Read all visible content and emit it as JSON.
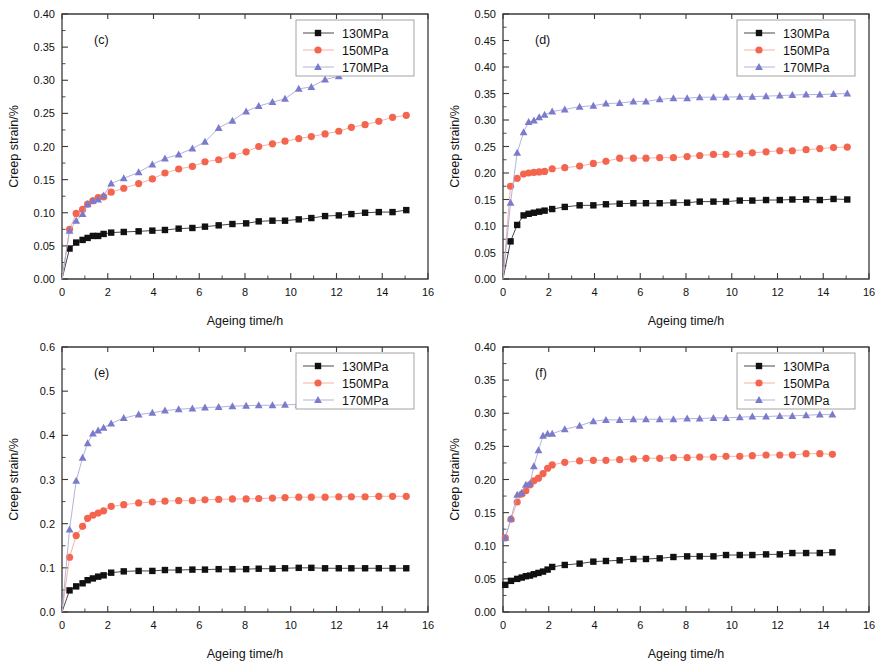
{
  "figure": {
    "panel_count": 4,
    "shared_xlabel": "Ageing time/h",
    "shared_ylabel": "Creep strain/%",
    "legend_entries": [
      "130MPa",
      "150MPa",
      "170MPa"
    ],
    "colors": {
      "130MPa": "#111111",
      "150MPa": "#F4654F",
      "170MPa": "#7B7BCB",
      "line_130MPa": "#333333",
      "line_150MPa": "#F6A79A",
      "line_170MPa": "#A9A9DC",
      "axis": "#3a3a3a",
      "background": "#ffffff"
    },
    "markers": {
      "130MPa": "filled-square",
      "150MPa": "filled-circle",
      "170MPa": "filled-triangle"
    }
  },
  "chart_data": [
    {
      "type": "line",
      "panel": "c",
      "panel_label": "(c)",
      "title": "",
      "xlabel": "Ageing time/h",
      "ylabel": "Creep strain/%",
      "xlim": [
        0,
        16
      ],
      "ylim": [
        0,
        0.4
      ],
      "xticks": [
        0,
        2,
        4,
        6,
        8,
        10,
        12,
        14,
        16
      ],
      "yticks": [
        0.0,
        0.05,
        0.1,
        0.15,
        0.2,
        0.25,
        0.3,
        0.35,
        0.4
      ],
      "ytick_labels": [
        "0.00",
        "0.05",
        "0.10",
        "0.15",
        "0.20",
        "0.25",
        "0.30",
        "0.35",
        "0.40"
      ],
      "grid": false,
      "legend_position": "top-right",
      "series": [
        {
          "name": "130MPa",
          "x": [
            0.0,
            0.33,
            0.62,
            0.9,
            1.12,
            1.35,
            1.58,
            1.82,
            2.15,
            2.7,
            3.35,
            3.95,
            4.5,
            5.1,
            5.7,
            6.25,
            6.85,
            7.45,
            8.05,
            8.6,
            9.2,
            9.75,
            10.35,
            10.9,
            11.5,
            12.1,
            12.65,
            13.25,
            13.85,
            14.45,
            15.05
          ],
          "values": [
            0.0,
            0.046,
            0.055,
            0.059,
            0.062,
            0.065,
            0.065,
            0.068,
            0.07,
            0.071,
            0.072,
            0.073,
            0.074,
            0.076,
            0.077,
            0.079,
            0.081,
            0.083,
            0.084,
            0.087,
            0.088,
            0.088,
            0.09,
            0.092,
            0.095,
            0.096,
            0.098,
            0.1,
            0.101,
            0.101,
            0.104
          ]
        },
        {
          "name": "150MPa",
          "x": [
            0.0,
            0.33,
            0.62,
            0.9,
            1.12,
            1.35,
            1.58,
            1.82,
            2.15,
            2.7,
            3.35,
            3.95,
            4.5,
            5.1,
            5.7,
            6.25,
            6.85,
            7.45,
            8.05,
            8.6,
            9.2,
            9.75,
            10.35,
            10.9,
            11.5,
            12.1,
            12.65,
            13.25,
            13.85,
            14.45,
            15.05
          ],
          "values": [
            0.0,
            0.075,
            0.099,
            0.105,
            0.113,
            0.118,
            0.123,
            0.124,
            0.131,
            0.137,
            0.144,
            0.151,
            0.16,
            0.166,
            0.17,
            0.177,
            0.18,
            0.186,
            0.192,
            0.2,
            0.204,
            0.208,
            0.212,
            0.215,
            0.219,
            0.223,
            0.229,
            0.233,
            0.238,
            0.244,
            0.247
          ]
        },
        {
          "name": "170MPa",
          "x": [
            0.0,
            0.33,
            0.62,
            0.9,
            1.12,
            1.35,
            1.58,
            1.82,
            2.15,
            2.7,
            3.35,
            3.95,
            4.5,
            5.1,
            5.7,
            6.25,
            6.85,
            7.45,
            8.05,
            8.6,
            9.2,
            9.75,
            10.35,
            10.9,
            11.5,
            12.1,
            12.65,
            13.25,
            13.85,
            14.45,
            15.05
          ],
          "values": [
            0.0,
            0.073,
            0.088,
            0.098,
            0.113,
            0.118,
            0.12,
            0.126,
            0.144,
            0.152,
            0.161,
            0.173,
            0.182,
            0.188,
            0.197,
            0.207,
            0.228,
            0.239,
            0.253,
            0.261,
            0.267,
            0.272,
            0.287,
            0.29,
            0.301,
            0.306,
            0.311,
            0.321,
            0.327,
            0.332,
            0.342
          ]
        }
      ]
    },
    {
      "type": "line",
      "panel": "d",
      "panel_label": "(d)",
      "title": "",
      "xlabel": "Ageing time/h",
      "ylabel": "Creep strain/%",
      "xlim": [
        0,
        16
      ],
      "ylim": [
        0,
        0.5
      ],
      "xticks": [
        0,
        2,
        4,
        6,
        8,
        10,
        12,
        14,
        16
      ],
      "yticks": [
        0.0,
        0.05,
        0.1,
        0.15,
        0.2,
        0.25,
        0.3,
        0.35,
        0.4,
        0.45,
        0.5
      ],
      "ytick_labels": [
        "0.00",
        "0.05",
        "0.10",
        "0.15",
        "0.20",
        "0.25",
        "0.30",
        "0.35",
        "0.40",
        "0.45",
        "0.50"
      ],
      "grid": false,
      "legend_position": "top-right",
      "series": [
        {
          "name": "130MPa",
          "x": [
            0.0,
            0.33,
            0.62,
            0.9,
            1.12,
            1.35,
            1.58,
            1.82,
            2.15,
            2.7,
            3.35,
            3.95,
            4.5,
            5.1,
            5.7,
            6.25,
            6.85,
            7.45,
            8.05,
            8.6,
            9.2,
            9.75,
            10.35,
            10.9,
            11.5,
            12.1,
            12.65,
            13.25,
            13.85,
            14.45,
            15.05
          ],
          "values": [
            0.0,
            0.071,
            0.102,
            0.12,
            0.123,
            0.125,
            0.127,
            0.129,
            0.132,
            0.136,
            0.139,
            0.139,
            0.141,
            0.142,
            0.143,
            0.143,
            0.143,
            0.144,
            0.144,
            0.146,
            0.146,
            0.146,
            0.148,
            0.148,
            0.149,
            0.149,
            0.15,
            0.15,
            0.149,
            0.151,
            0.15
          ]
        },
        {
          "name": "150MPa",
          "x": [
            0.0,
            0.33,
            0.62,
            0.9,
            1.12,
            1.35,
            1.58,
            1.82,
            2.15,
            2.7,
            3.35,
            3.95,
            4.5,
            5.1,
            5.7,
            6.25,
            6.85,
            7.45,
            8.05,
            8.6,
            9.2,
            9.75,
            10.35,
            10.9,
            11.5,
            12.1,
            12.65,
            13.25,
            13.85,
            14.45,
            15.05
          ],
          "values": [
            0.0,
            0.175,
            0.19,
            0.198,
            0.2,
            0.201,
            0.202,
            0.203,
            0.208,
            0.21,
            0.213,
            0.218,
            0.222,
            0.228,
            0.228,
            0.228,
            0.229,
            0.229,
            0.231,
            0.233,
            0.235,
            0.235,
            0.236,
            0.238,
            0.24,
            0.242,
            0.242,
            0.244,
            0.246,
            0.248,
            0.249
          ]
        },
        {
          "name": "170MPa",
          "x": [
            0.0,
            0.33,
            0.62,
            0.9,
            1.12,
            1.35,
            1.58,
            1.82,
            2.15,
            2.7,
            3.35,
            3.95,
            4.5,
            5.1,
            5.7,
            6.25,
            6.85,
            7.45,
            8.05,
            8.6,
            9.2,
            9.75,
            10.35,
            10.9,
            11.5,
            12.1,
            12.65,
            13.25,
            13.85,
            14.45,
            15.05
          ],
          "values": [
            0.0,
            0.144,
            0.238,
            0.277,
            0.296,
            0.299,
            0.305,
            0.31,
            0.316,
            0.32,
            0.325,
            0.327,
            0.331,
            0.332,
            0.335,
            0.335,
            0.339,
            0.341,
            0.341,
            0.343,
            0.343,
            0.343,
            0.344,
            0.344,
            0.345,
            0.346,
            0.347,
            0.348,
            0.348,
            0.349,
            0.35
          ]
        }
      ]
    },
    {
      "type": "line",
      "panel": "e",
      "panel_label": "(e)",
      "title": "",
      "xlabel": "Ageing time/h",
      "ylabel": "Creep strain/%",
      "xlim": [
        0,
        16
      ],
      "ylim": [
        0,
        0.6
      ],
      "xticks": [
        0,
        2,
        4,
        6,
        8,
        10,
        12,
        14,
        16
      ],
      "yticks": [
        0.0,
        0.1,
        0.2,
        0.3,
        0.4,
        0.5,
        0.6
      ],
      "ytick_labels": [
        "0.0",
        "0.1",
        "0.2",
        "0.3",
        "0.4",
        "0.5",
        "0.6"
      ],
      "grid": false,
      "legend_position": "top-right",
      "series": [
        {
          "name": "130MPa",
          "x": [
            0.0,
            0.33,
            0.62,
            0.9,
            1.12,
            1.35,
            1.58,
            1.82,
            2.15,
            2.7,
            3.35,
            3.95,
            4.5,
            5.1,
            5.7,
            6.25,
            6.85,
            7.45,
            8.05,
            8.6,
            9.2,
            9.75,
            10.35,
            10.9,
            11.5,
            12.1,
            12.65,
            13.25,
            13.85,
            14.45,
            15.05
          ],
          "values": [
            0.0,
            0.049,
            0.058,
            0.065,
            0.072,
            0.076,
            0.08,
            0.083,
            0.089,
            0.092,
            0.093,
            0.093,
            0.095,
            0.095,
            0.096,
            0.096,
            0.097,
            0.097,
            0.097,
            0.098,
            0.098,
            0.099,
            0.1,
            0.1,
            0.099,
            0.099,
            0.099,
            0.099,
            0.099,
            0.099,
            0.099
          ]
        },
        {
          "name": "150MPa",
          "x": [
            0.0,
            0.33,
            0.62,
            0.9,
            1.12,
            1.35,
            1.58,
            1.82,
            2.15,
            2.7,
            3.35,
            3.95,
            4.5,
            5.1,
            5.7,
            6.25,
            6.85,
            7.45,
            8.05,
            8.6,
            9.2,
            9.75,
            10.35,
            10.9,
            11.5,
            12.1,
            12.65,
            13.25,
            13.85,
            14.45,
            15.05
          ],
          "values": [
            0.0,
            0.124,
            0.173,
            0.194,
            0.212,
            0.219,
            0.224,
            0.229,
            0.239,
            0.243,
            0.247,
            0.249,
            0.251,
            0.252,
            0.252,
            0.254,
            0.255,
            0.256,
            0.256,
            0.257,
            0.258,
            0.259,
            0.26,
            0.26,
            0.26,
            0.261,
            0.261,
            0.261,
            0.262,
            0.262,
            0.262
          ]
        },
        {
          "name": "170MPa",
          "x": [
            0.0,
            0.33,
            0.62,
            0.9,
            1.12,
            1.35,
            1.58,
            1.82,
            2.15,
            2.7,
            3.35,
            3.95,
            4.5,
            5.1,
            5.7,
            6.25,
            6.85,
            7.45,
            8.05,
            8.6,
            9.2,
            9.75,
            10.35,
            10.9,
            11.5,
            12.1,
            12.65,
            13.25,
            13.85,
            14.45,
            15.05
          ],
          "values": [
            0.0,
            0.187,
            0.297,
            0.349,
            0.382,
            0.404,
            0.411,
            0.417,
            0.427,
            0.439,
            0.447,
            0.451,
            0.456,
            0.459,
            0.461,
            0.463,
            0.464,
            0.466,
            0.467,
            0.468,
            0.468,
            0.469,
            0.47,
            0.47,
            0.471,
            0.472,
            0.472,
            0.473,
            0.474,
            0.475,
            0.475
          ]
        }
      ]
    },
    {
      "type": "line",
      "panel": "f",
      "panel_label": "(f)",
      "title": "",
      "xlabel": "Ageing time/h",
      "ylabel": "Creep strain/%",
      "xlim": [
        0,
        16
      ],
      "ylim": [
        0,
        0.4
      ],
      "xticks": [
        0,
        2,
        4,
        6,
        8,
        10,
        12,
        14,
        16
      ],
      "yticks": [
        0.0,
        0.05,
        0.1,
        0.15,
        0.2,
        0.25,
        0.3,
        0.35,
        0.4
      ],
      "ytick_labels": [
        "0.00",
        "0.05",
        "0.10",
        "0.15",
        "0.20",
        "0.25",
        "0.30",
        "0.35",
        "0.40"
      ],
      "grid": false,
      "legend_position": "top-right",
      "series": [
        {
          "name": "130MPa",
          "x": [
            0.1,
            0.35,
            0.62,
            0.82,
            1.0,
            1.18,
            1.35,
            1.55,
            1.75,
            1.95,
            2.15,
            2.7,
            3.35,
            3.95,
            4.5,
            5.1,
            5.7,
            6.25,
            6.85,
            7.45,
            8.05,
            8.6,
            9.2,
            9.75,
            10.35,
            10.9,
            11.5,
            12.1,
            12.65,
            13.25,
            13.85,
            14.4
          ],
          "values": [
            0.041,
            0.047,
            0.05,
            0.052,
            0.054,
            0.055,
            0.057,
            0.059,
            0.061,
            0.064,
            0.068,
            0.071,
            0.073,
            0.076,
            0.077,
            0.078,
            0.08,
            0.08,
            0.081,
            0.083,
            0.084,
            0.084,
            0.084,
            0.086,
            0.086,
            0.086,
            0.087,
            0.087,
            0.089,
            0.089,
            0.089,
            0.09
          ]
        },
        {
          "name": "150MPa",
          "x": [
            0.1,
            0.35,
            0.62,
            0.82,
            1.0,
            1.18,
            1.35,
            1.55,
            1.75,
            1.95,
            2.15,
            2.7,
            3.35,
            3.95,
            4.5,
            5.1,
            5.7,
            6.25,
            6.85,
            7.45,
            8.05,
            8.6,
            9.2,
            9.75,
            10.35,
            10.9,
            11.5,
            12.1,
            12.65,
            13.25,
            13.85,
            14.4
          ],
          "values": [
            0.112,
            0.14,
            0.166,
            0.178,
            0.183,
            0.192,
            0.198,
            0.202,
            0.209,
            0.217,
            0.222,
            0.226,
            0.228,
            0.229,
            0.229,
            0.23,
            0.231,
            0.232,
            0.232,
            0.233,
            0.233,
            0.234,
            0.234,
            0.235,
            0.235,
            0.236,
            0.237,
            0.237,
            0.237,
            0.239,
            0.239,
            0.238
          ]
        },
        {
          "name": "170MPa",
          "x": [
            0.1,
            0.35,
            0.62,
            0.82,
            1.0,
            1.18,
            1.35,
            1.55,
            1.75,
            1.95,
            2.15,
            2.7,
            3.35,
            3.95,
            4.5,
            5.1,
            5.7,
            6.25,
            6.85,
            7.45,
            8.05,
            8.6,
            9.2,
            9.75,
            10.35,
            10.9,
            11.5,
            12.1,
            12.65,
            13.25,
            13.85,
            14.4
          ],
          "values": [
            0.112,
            0.141,
            0.177,
            0.18,
            0.192,
            0.194,
            0.22,
            0.244,
            0.266,
            0.269,
            0.269,
            0.276,
            0.281,
            0.288,
            0.29,
            0.29,
            0.291,
            0.291,
            0.291,
            0.291,
            0.292,
            0.292,
            0.293,
            0.293,
            0.294,
            0.295,
            0.295,
            0.296,
            0.296,
            0.297,
            0.298,
            0.298
          ]
        }
      ]
    }
  ]
}
